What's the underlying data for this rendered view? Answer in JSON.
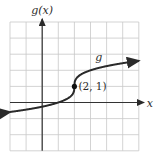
{
  "chart_data": {
    "type": "line",
    "title": "",
    "xlabel": "x",
    "ylabel": "g(x)",
    "xlim": [
      -2,
      6
    ],
    "ylim": [
      -3,
      5
    ],
    "grid": true,
    "grid_step": 1,
    "series": [
      {
        "name": "g",
        "function": "cbrt(x - 2) + 1",
        "x": [
          -2,
          -1,
          0,
          1,
          1.5,
          1.9,
          2,
          2.1,
          2.5,
          3,
          4,
          5,
          6
        ],
        "y": [
          -0.587,
          -0.442,
          -0.26,
          0,
          0.206,
          0.536,
          1,
          1.464,
          1.794,
          2,
          2.26,
          2.442,
          2.587
        ],
        "arrows": "both"
      }
    ],
    "annotations": [
      {
        "label": "(2, 1)",
        "x": 2,
        "y": 1,
        "marker": "dot"
      },
      {
        "label": "g",
        "x": 3.3,
        "y": 2.6
      }
    ],
    "color": "#2a2a2a"
  }
}
